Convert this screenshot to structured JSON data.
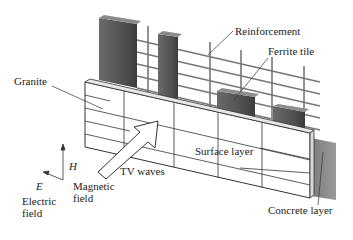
{
  "diagram": {
    "labels": {
      "reinforcement": "Reinforcement",
      "ferrite_tile": "Ferrite tile",
      "granite": "Granite",
      "surface_layer": "Surface layer",
      "tv_waves": "TV waves",
      "h_symbol": "H",
      "e_symbol": "E",
      "magnetic_field_line1": "Magnetic",
      "magnetic_field_line2": "field",
      "electric_field_line1": "Electric",
      "electric_field_line2": "field",
      "concrete_layer": "Concrete layer"
    },
    "colors": {
      "tile_dark": "#5a5a5a",
      "tile_mid": "#7a7a7a",
      "concrete": "#8a8a8a",
      "line": "#333333"
    }
  }
}
